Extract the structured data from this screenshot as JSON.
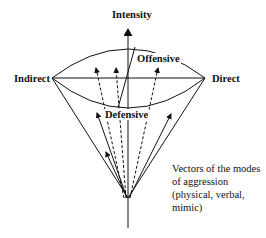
{
  "diagram": {
    "axis_label_top": "Intensity",
    "label_left": "Indirect",
    "label_right": "Direct",
    "label_offensive": "Offensive",
    "label_defensive": "Defensive",
    "caption_lines": [
      "Vectors of the modes",
      "of aggression",
      "(physical, verbal,",
      "mimic)"
    ],
    "colors": {
      "line": "#111111",
      "background": "#ffffff"
    }
  }
}
